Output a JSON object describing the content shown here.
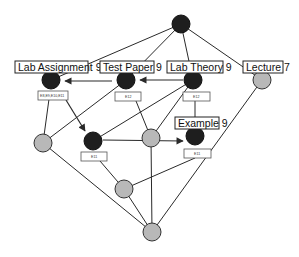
{
  "diagram": {
    "type": "concept-lattice",
    "colors": {
      "dark_node": "#1e1e1e",
      "gray_node": "#b8b8b8",
      "edge": "#2a2a2a",
      "background": "#ffffff"
    },
    "nodes": [
      {
        "id": "top",
        "x": 181,
        "y": 24,
        "r": 9,
        "style": "dark"
      },
      {
        "id": "lab-assignment-9",
        "x": 51,
        "y": 80,
        "r": 9,
        "style": "dark",
        "label": "Lab Assignment 9",
        "extent": "E8,E9,E10,E11"
      },
      {
        "id": "test-paper-9",
        "x": 126,
        "y": 80,
        "r": 9,
        "style": "dark",
        "label": "Test Paper 9",
        "extent": "E12"
      },
      {
        "id": "lab-theory-9",
        "x": 193,
        "y": 80,
        "r": 9,
        "style": "dark",
        "label": "Lab Theory 9",
        "extent": "E12"
      },
      {
        "id": "lecture-7",
        "x": 262,
        "y": 80,
        "r": 9,
        "style": "gray",
        "label": "Lecture 7"
      },
      {
        "id": "left-mid",
        "x": 43,
        "y": 143,
        "r": 9,
        "style": "gray"
      },
      {
        "id": "mid-dark",
        "x": 93,
        "y": 141,
        "r": 9,
        "style": "dark",
        "extent": "E11"
      },
      {
        "id": "center",
        "x": 151,
        "y": 138,
        "r": 9,
        "style": "gray"
      },
      {
        "id": "example-9",
        "x": 195,
        "y": 136,
        "r": 9,
        "style": "dark",
        "label": "Example 9",
        "extent": "E11"
      },
      {
        "id": "lower",
        "x": 124,
        "y": 189,
        "r": 9,
        "style": "gray"
      },
      {
        "id": "bottom",
        "x": 152,
        "y": 232,
        "r": 9,
        "style": "gray"
      }
    ],
    "labels": {
      "lab_assignment": "Lab Assignment 9",
      "test_paper": "Test Paper 9",
      "lab_theory": "Lab Theory 9",
      "lecture": "Lecture 7",
      "example": "Example 9",
      "extent_lab_assignment": "E8,E9,E10,E11",
      "extent_test_paper": "E12",
      "extent_lab_theory": "E12",
      "extent_mid_dark": "E11",
      "extent_example": "E11"
    },
    "edges": [
      [
        "top",
        "lab-assignment-9"
      ],
      [
        "top",
        "test-paper-9"
      ],
      [
        "top",
        "lab-theory-9"
      ],
      [
        "top",
        "lecture-7"
      ],
      [
        "lab-assignment-9",
        "left-mid"
      ],
      [
        "test-paper-9",
        "left-mid"
      ],
      [
        "test-paper-9",
        "center"
      ],
      [
        "lab-theory-9",
        "mid-dark"
      ],
      [
        "lab-theory-9",
        "center"
      ],
      [
        "lab-theory-9",
        "example-9"
      ],
      [
        "lecture-7",
        "bottom"
      ],
      [
        "left-mid",
        "bottom"
      ],
      [
        "mid-dark",
        "lower"
      ],
      [
        "center",
        "bottom"
      ],
      [
        "example-9",
        "lower"
      ],
      [
        "lower",
        "bottom"
      ]
    ],
    "arrows": [
      {
        "from": "test-paper-9",
        "to": "lab-assignment-9"
      },
      {
        "from": "lab-theory-9",
        "to": "test-paper-9"
      },
      {
        "from": "lab-assignment-9",
        "to": "mid-dark"
      },
      {
        "from": "mid-dark",
        "to": "example-9"
      }
    ]
  }
}
